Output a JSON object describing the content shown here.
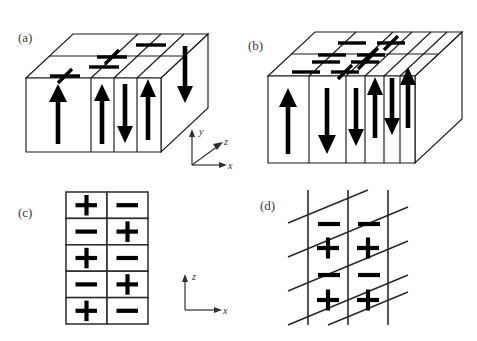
{
  "figure": {
    "background_color": "#ffffff",
    "line_color": "#1a1a1a",
    "symbol_color": "#000000",
    "width": 477,
    "height": 341
  },
  "panels": [
    {
      "id": "a",
      "label": "(a)",
      "type": "3d-block-perspective",
      "description": "Single elongated block divided into vertical slabs with alternating out-of-plane arrows; top face carries alternating plus and minus signs",
      "front_arrows": [
        "up",
        "up",
        "down",
        "up",
        "down"
      ],
      "top_face_symbols": [
        [
          "-",
          "+"
        ],
        [
          "-",
          "+"
        ]
      ],
      "axis": {
        "type": "3d-triad",
        "labels": [
          "y",
          "z",
          "x"
        ],
        "y_direction": "up",
        "z_direction": "up-right-diagonal",
        "x_direction": "right"
      }
    },
    {
      "id": "b",
      "label": "(b)",
      "type": "3d-block-perspective",
      "description": "Elongated block subdivided into six slabs with alternating arrows; top face carries a two-by-four array of alternating plus and minus signs",
      "front_arrows": [
        "up",
        "down",
        "down",
        "up",
        "down",
        "up"
      ],
      "top_face_symbols": [
        [
          "-",
          "+",
          "-",
          "+"
        ],
        [
          "-",
          "+",
          "-",
          "+"
        ]
      ],
      "axis": null
    },
    {
      "id": "c",
      "label": "(c)",
      "type": "2d-rectangular-grid",
      "description": "Two column by five row rectangular grid with checkerboard plus and minus signs",
      "columns": 2,
      "rows": 5,
      "cells": [
        [
          "+",
          "-"
        ],
        [
          "-",
          "+"
        ],
        [
          "+",
          "-"
        ],
        [
          "-",
          "+"
        ],
        [
          "+",
          "-"
        ]
      ],
      "axis": {
        "type": "2d-triad",
        "labels": [
          "z",
          "x"
        ],
        "z_direction": "up",
        "x_direction": "right"
      }
    },
    {
      "id": "d",
      "label": "(d)",
      "type": "2d-sheared-grid",
      "description": "Sheared grid of slanted parallelogram cells bounded by three vertical lines and five slanted lines; each column alternates minus and plus",
      "columns": 2,
      "rows": 4,
      "vertical_line_count": 3,
      "slant_line_count": 5,
      "cells": [
        [
          "-",
          "-"
        ],
        [
          "+",
          "+"
        ],
        [
          "-",
          "-"
        ],
        [
          "+",
          "+"
        ]
      ],
      "axis": null
    }
  ]
}
